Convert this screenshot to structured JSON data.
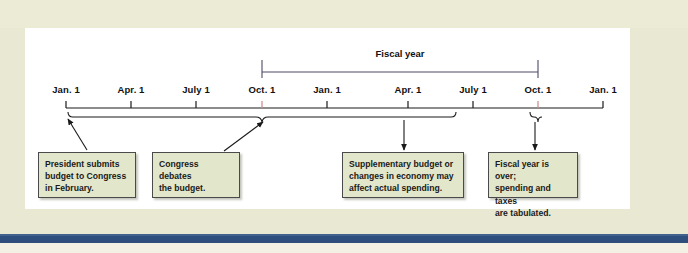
{
  "figure": {
    "background_color": "#e9e8d2",
    "panel_color": "#ffffff",
    "rule_color": "#2e4f7d",
    "note_fill": "#e2e6cb",
    "note_border": "#4a4a4a"
  },
  "timeline": {
    "axis_label": "Timeline of federal budget process",
    "ticks": [
      {
        "label": "Jan. 1",
        "x": 66
      },
      {
        "label": "Apr. 1",
        "x": 131
      },
      {
        "label": "July 1",
        "x": 196
      },
      {
        "label": "Oct. 1",
        "x": 262
      },
      {
        "label": "Jan. 1",
        "x": 327
      },
      {
        "label": "Apr. 1",
        "x": 408
      },
      {
        "label": "July 1",
        "x": 473
      },
      {
        "label": "Oct. 1",
        "x": 538
      },
      {
        "label": "Jan. 1",
        "x": 603
      }
    ]
  },
  "fiscal_year": {
    "label": "Fiscal year",
    "start_tick": "Oct. 1",
    "end_tick": "Oct. 1",
    "start_x": 262,
    "end_x": 538,
    "label_x": 400
  },
  "notes": [
    {
      "id": "note-president-submits",
      "lines": [
        "President submits",
        "budget to Congress",
        "in February."
      ],
      "x": 38,
      "y": 152,
      "width": 98,
      "height": 46
    },
    {
      "id": "note-congress-debates",
      "lines": [
        "Congress debates",
        "the budget."
      ],
      "x": 152,
      "y": 152,
      "width": 88,
      "height": 46
    },
    {
      "id": "note-supplementary-budget",
      "lines": [
        "Supplementary budget or",
        "changes in economy may",
        "affect actual spending."
      ],
      "x": 342,
      "y": 152,
      "width": 122,
      "height": 46
    },
    {
      "id": "note-fiscal-year-over",
      "lines": [
        "Fiscal year is over;",
        "spending and taxes",
        "are tabulated."
      ],
      "x": 488,
      "y": 152,
      "width": 90,
      "height": 46
    }
  ]
}
